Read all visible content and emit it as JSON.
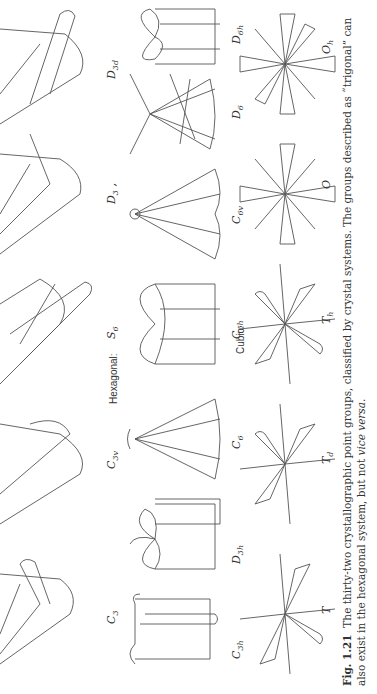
{
  "figure": {
    "rows": [
      {
        "section_label": "",
        "groups": [
          {
            "symbol": "C",
            "sub": "3"
          },
          {
            "symbol": "C",
            "sub": "3v"
          },
          {
            "symbol": "S",
            "sub": "6"
          },
          {
            "symbol": "D",
            "sub": "3",
            "suffix": " ,"
          },
          {
            "symbol": "D",
            "sub": "3d"
          }
        ]
      },
      {
        "section_label": "Hexagonal:",
        "groups": [
          {
            "symbol": "C",
            "sub": "3h"
          },
          {
            "symbol": "D",
            "sub": "3h"
          },
          {
            "symbol": "C",
            "sub": "6"
          },
          {
            "symbol": "C",
            "sub": "6h"
          },
          {
            "symbol": "C",
            "sub": "6v"
          },
          {
            "symbol": "D",
            "sub": "6"
          },
          {
            "symbol": "D",
            "sub": "6h"
          }
        ]
      },
      {
        "section_label": "Cubic:",
        "groups": [
          {
            "symbol": "T",
            "sub": ""
          },
          {
            "symbol": "T",
            "sub": "d"
          },
          {
            "symbol": "T",
            "sub": "h"
          },
          {
            "symbol": "O",
            "sub": ""
          },
          {
            "symbol": "O",
            "sub": "h"
          }
        ]
      }
    ]
  },
  "caption": {
    "number": "Fig. 1.21",
    "text_1": "The thirty-two crystallographic point groups, classified by crystal systems.  The groups described as “trigonal” can also exist in the hexagonal system, but not ",
    "emph": "vice versa",
    "text_2": "."
  }
}
